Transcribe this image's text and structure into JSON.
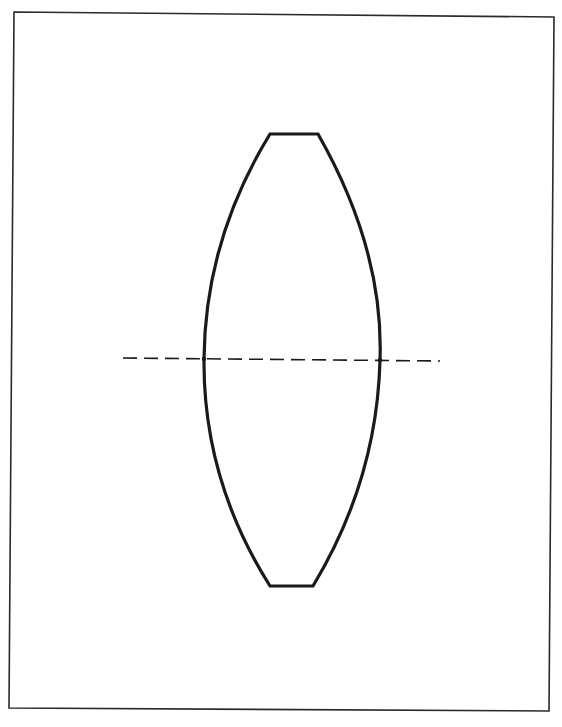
{
  "diagram": {
    "type": "biconvex-lens",
    "frame": {
      "corners": [
        [
          14,
          12
        ],
        [
          554,
          17
        ],
        [
          549,
          711
        ],
        [
          9,
          708
        ]
      ],
      "stroke": "#2a2a2a",
      "stroke_width": 1.6
    },
    "lens": {
      "top_edge": {
        "x1": 270,
        "x2": 318,
        "y": 134
      },
      "bottom_edge": {
        "x1": 270,
        "x2": 313,
        "y": 586
      },
      "left_apex": {
        "x": 204,
        "y": 359
      },
      "right_apex": {
        "x": 380,
        "y": 360
      },
      "stroke": "#1a1a1a",
      "stroke_width": 3.2
    },
    "optical_axis": {
      "x1": 123,
      "y1": 358,
      "x2": 440,
      "y2": 361,
      "dash": "14 7",
      "stroke": "#1a1a1a",
      "stroke_width": 1.6
    }
  }
}
